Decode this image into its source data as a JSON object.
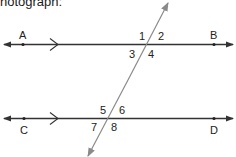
{
  "caption": "hotograph:",
  "diagram": {
    "colors": {
      "line": "#333333",
      "transversal": "#8a8a8a",
      "text": "#222222"
    },
    "parallel_lines": [
      {
        "id": "AB",
        "points": [
          {
            "label": "A"
          },
          {
            "label": "B"
          }
        ],
        "parallel_marker": ">"
      },
      {
        "id": "CD",
        "points": [
          {
            "label": "C"
          },
          {
            "label": "D"
          }
        ],
        "parallel_marker": ">"
      }
    ],
    "transversal": {
      "arrows": "both"
    },
    "angles": {
      "a1": "1",
      "a2": "2",
      "a3": "3",
      "a4": "4",
      "a5": "5",
      "a6": "6",
      "a7": "7",
      "a8": "8"
    },
    "labels": {
      "A": "A",
      "B": "B",
      "C": "C",
      "D": "D"
    }
  }
}
